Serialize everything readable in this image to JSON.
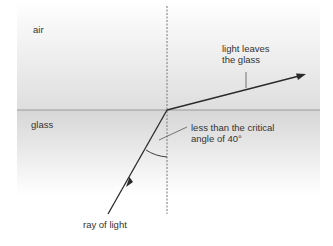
{
  "diagram": {
    "labels": {
      "air": "air",
      "glass": "glass",
      "light_leaves_line1": "light leaves",
      "light_leaves_line2": "the glass",
      "angle_line1": "less than the critical",
      "angle_line2": "angle of 40°",
      "ray": "ray of light"
    },
    "critical_angle_deg": 40,
    "colors": {
      "ray": "#2a2a2a",
      "normal": "#777777",
      "interface": "#9a9a9a",
      "air_bottom": "#dedede",
      "glass_top": "#d6d6d6",
      "background": "#ffffff"
    }
  }
}
